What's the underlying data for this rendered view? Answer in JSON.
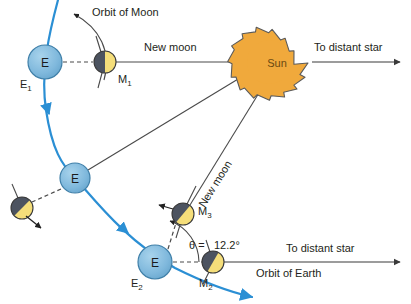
{
  "figure": {
    "kind": "astronomy-diagram",
    "topic": "Sidereal versus synodic month: Earth-Moon-Sun geometry",
    "width": 411,
    "height": 304
  },
  "colors": {
    "earth_fill": "#7FB8DC",
    "earth_stroke": "#3F7FA8",
    "orbit_blue": "#2B8FD4",
    "sun_fill": "#F0A93C",
    "sun_stroke": "#4a4a4a",
    "moon_dark": "#4C5360",
    "moon_lit": "#F5DE7A",
    "line_gray": "#5a5a5a",
    "text": "#231f20",
    "background": "#ffffff"
  },
  "bodies": {
    "earths": [
      {
        "name": "earth-1",
        "letter": "E",
        "label": "E",
        "sublabel": "1",
        "cx": 45,
        "cy": 62,
        "r": 17
      },
      {
        "name": "earth-mid",
        "letter": "E",
        "label": "E",
        "sublabel": "",
        "cx": 75,
        "cy": 178,
        "r": 15
      },
      {
        "name": "earth-2",
        "letter": "E",
        "label": "E",
        "sublabel": "2",
        "cx": 155,
        "cy": 262,
        "r": 17
      }
    ],
    "moons": [
      {
        "name": "moon-1",
        "label": "M",
        "sublabel": "1",
        "cx": 105,
        "cy": 62,
        "r": 11,
        "lit_angle_deg": 0
      },
      {
        "name": "moon-left",
        "label": "",
        "sublabel": "",
        "cx": 22,
        "cy": 208,
        "r": 11,
        "lit_angle_deg": 45
      },
      {
        "name": "moon-3",
        "label": "M",
        "sublabel": "3",
        "cx": 183,
        "cy": 214,
        "r": 11,
        "lit_angle_deg": 40
      },
      {
        "name": "moon-2",
        "label": "M",
        "sublabel": "2",
        "cx": 213,
        "cy": 262,
        "r": 11,
        "lit_angle_deg": 30
      }
    ],
    "sun": {
      "name": "sun",
      "label": "Sun",
      "cx": 277,
      "cy": 63,
      "r_outer": 31,
      "r_inner": 23,
      "points": 16
    }
  },
  "labels": {
    "orbit_of_moon": "Orbit of Moon",
    "orbit_of_earth": "Orbit of Earth",
    "new_moon_top": "New moon",
    "new_moon_diagonal": "New moon",
    "to_distant_star_top": "To distant star",
    "to_distant_star_bottom": "To distant star",
    "sun": "Sun",
    "earth_1": "E",
    "earth_1_sub": "1",
    "earth_2": "E",
    "earth_2_sub": "2",
    "moon_1": "M",
    "moon_1_sub": "1",
    "moon_2": "M",
    "moon_2_sub": "2",
    "moon_3": "M",
    "moon_3_sub": "3",
    "theta_equals": "θ =",
    "theta_value": "12.2°"
  },
  "measurements": {
    "theta_symbol": "θ",
    "theta_degrees": 12.2,
    "theta_unit": "degrees"
  }
}
